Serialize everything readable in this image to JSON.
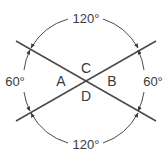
{
  "diagram": {
    "angles": {
      "top": "120°",
      "bottom": "120°",
      "left": "60°",
      "right": "60°"
    },
    "regions": {
      "left": "A",
      "right": "B",
      "top": "C",
      "bottom": "D"
    },
    "colors": {
      "line": "#4a4a4a",
      "arc": "#4a4a4a",
      "text": "#3a3a3a",
      "background": "#ffffff"
    }
  }
}
